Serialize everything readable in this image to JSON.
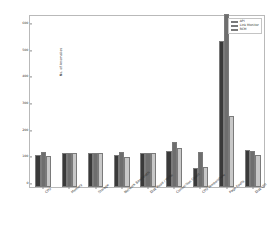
{
  "chart_data": {
    "type": "bar",
    "title": "",
    "xlabel": "",
    "ylabel": "No. of Anomalies",
    "ylim": [
      0,
      650
    ],
    "yticks": [
      0,
      100,
      200,
      300,
      400,
      500,
      600
    ],
    "ytick_labels": [
      "0",
      "100",
      "200",
      "300",
      "400",
      "500",
      "600"
    ],
    "grid": false,
    "legend_position": "upper right",
    "categories": [
      "CPU",
      "Memory",
      "Storage",
      "Network Bandwidth",
      "Disk Read / Write",
      "Connection Count",
      "CPU Temperature",
      "Page Faults",
      "Disk Util"
    ],
    "series": [
      {
        "name": "API",
        "color": "#3a3a3a",
        "values": [
          122,
          127,
          128,
          121,
          127,
          134,
          70,
          550,
          140
        ]
      },
      {
        "name": "Link Monitor",
        "color": "#6e6e6e",
        "values": [
          133,
          128,
          128,
          133,
          128,
          170,
          130,
          650,
          136
        ]
      },
      {
        "name": "RCM",
        "color": "#c8c8c8",
        "values": [
          117,
          126,
          126,
          112,
          128,
          147,
          75,
          265,
          121
        ]
      }
    ]
  },
  "legend": {
    "items": [
      {
        "label": "API",
        "color": "#3a3a3a"
      },
      {
        "label": "Link Monitor",
        "color": "#6e6e6e"
      },
      {
        "label": "RCM",
        "color": "#c8c8c8"
      }
    ]
  }
}
